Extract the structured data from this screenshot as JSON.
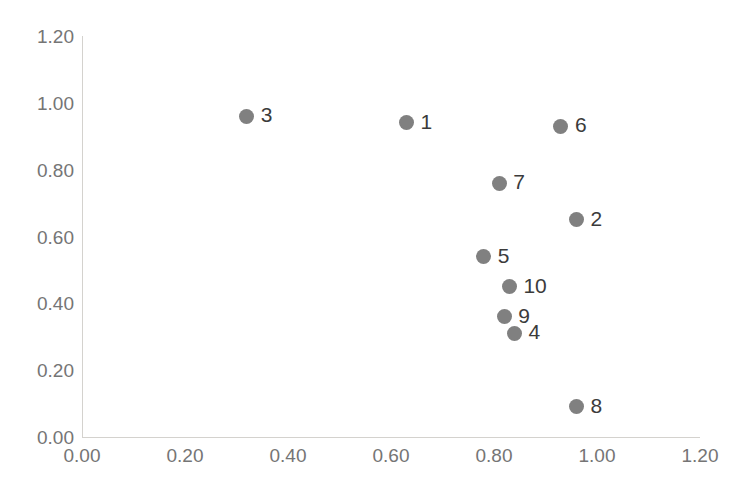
{
  "chart_data": {
    "type": "scatter",
    "title": "",
    "xlabel": "",
    "ylabel": "",
    "xlim": [
      0.0,
      1.2
    ],
    "ylim": [
      0.0,
      1.2
    ],
    "grid": false,
    "legend": null,
    "marker_color": "#808080",
    "axis_color": "#d4d2ce",
    "tick_label_color": "#757575",
    "point_label_color": "#3b3b3b",
    "xticks": [
      "0.00",
      "0.20",
      "0.40",
      "0.60",
      "0.80",
      "1.00",
      "1.20"
    ],
    "yticks": [
      "0.00",
      "0.20",
      "0.40",
      "0.60",
      "0.80",
      "1.00",
      "1.20"
    ],
    "xtick_values": [
      0.0,
      0.2,
      0.4,
      0.6,
      0.8,
      1.0,
      1.2
    ],
    "ytick_values": [
      0.0,
      0.2,
      0.4,
      0.6,
      0.8,
      1.0,
      1.2
    ],
    "points": [
      {
        "label": "1",
        "x": 0.63,
        "y": 0.94
      },
      {
        "label": "2",
        "x": 0.96,
        "y": 0.65
      },
      {
        "label": "3",
        "x": 0.32,
        "y": 0.96
      },
      {
        "label": "4",
        "x": 0.84,
        "y": 0.31
      },
      {
        "label": "5",
        "x": 0.78,
        "y": 0.54
      },
      {
        "label": "6",
        "x": 0.93,
        "y": 0.93
      },
      {
        "label": "7",
        "x": 0.81,
        "y": 0.76
      },
      {
        "label": "8",
        "x": 0.96,
        "y": 0.09
      },
      {
        "label": "9",
        "x": 0.82,
        "y": 0.36
      },
      {
        "label": "10",
        "x": 0.83,
        "y": 0.45
      }
    ]
  }
}
